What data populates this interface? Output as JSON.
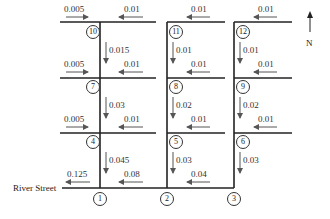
{
  "diagram": {
    "title": "",
    "street_label": "River Street",
    "compass": {
      "label": "N",
      "direction": "up"
    },
    "colors": {
      "line": "#222222",
      "arrow": "#555555",
      "text": "#333333"
    },
    "nodes": [
      {
        "id": "1",
        "label": "1"
      },
      {
        "id": "2",
        "label": "2"
      },
      {
        "id": "3",
        "label": "3"
      },
      {
        "id": "4",
        "label": "4"
      },
      {
        "id": "5",
        "label": "5"
      },
      {
        "id": "6",
        "label": "6"
      },
      {
        "id": "7",
        "label": "7"
      },
      {
        "id": "8",
        "label": "8"
      },
      {
        "id": "9",
        "label": "9"
      },
      {
        "id": "10",
        "label": "10"
      },
      {
        "id": "11",
        "label": "11"
      },
      {
        "id": "12",
        "label": "12"
      }
    ],
    "flows": [
      {
        "id": "f_in_10_w",
        "value": "0.005",
        "direction": "east",
        "location": "west of node 10"
      },
      {
        "id": "f_in_10_e",
        "value": "0.01",
        "direction": "west",
        "location": "east of node 10"
      },
      {
        "id": "f_in_11",
        "value": "0.01",
        "direction": "west",
        "location": "east of node 11"
      },
      {
        "id": "f_in_12",
        "value": "0.01",
        "direction": "west",
        "location": "east of node 12"
      },
      {
        "id": "f_10_7",
        "value": "0.015",
        "direction": "south",
        "location": "node 10 to node 7"
      },
      {
        "id": "f_11_8",
        "value": "0.01",
        "direction": "south",
        "location": "node 11 to node 8"
      },
      {
        "id": "f_12_9",
        "value": "0.01",
        "direction": "south",
        "location": "node 12 to node 9"
      },
      {
        "id": "f_in_7_w",
        "value": "0.005",
        "direction": "east",
        "location": "west of node 7"
      },
      {
        "id": "f_in_7_e",
        "value": "0.01",
        "direction": "west",
        "location": "east of node 7"
      },
      {
        "id": "f_in_8",
        "value": "0.01",
        "direction": "west",
        "location": "east of node 8"
      },
      {
        "id": "f_in_9",
        "value": "0.01",
        "direction": "west",
        "location": "east of node 9"
      },
      {
        "id": "f_7_4",
        "value": "0.03",
        "direction": "south",
        "location": "node 7 to node 4"
      },
      {
        "id": "f_8_5",
        "value": "0.02",
        "direction": "south",
        "location": "node 8 to node 5"
      },
      {
        "id": "f_9_6",
        "value": "0.02",
        "direction": "south",
        "location": "node 9 to node 6"
      },
      {
        "id": "f_in_4_w",
        "value": "0.005",
        "direction": "east",
        "location": "west of node 4"
      },
      {
        "id": "f_in_4_e",
        "value": "0.01",
        "direction": "west",
        "location": "east of node 4"
      },
      {
        "id": "f_in_5",
        "value": "0.01",
        "direction": "west",
        "location": "east of node 5"
      },
      {
        "id": "f_in_6",
        "value": "0.01",
        "direction": "west",
        "location": "east of node 6"
      },
      {
        "id": "f_4_1",
        "value": "0.045",
        "direction": "south",
        "location": "node 4 to node 1"
      },
      {
        "id": "f_5_2",
        "value": "0.03",
        "direction": "south",
        "location": "node 5 to node 2"
      },
      {
        "id": "f_6_3",
        "value": "0.03",
        "direction": "south",
        "location": "node 6 to node 3"
      },
      {
        "id": "f_out_1",
        "value": "0.125",
        "direction": "west",
        "location": "west of node 1 (River Street)"
      },
      {
        "id": "f_2_1",
        "value": "0.08",
        "direction": "west",
        "location": "node 2 to node 1"
      },
      {
        "id": "f_3_2",
        "value": "0.04",
        "direction": "west",
        "location": "node 3 to node 2"
      }
    ]
  }
}
